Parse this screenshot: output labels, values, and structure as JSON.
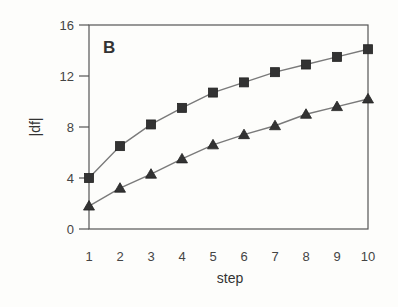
{
  "chart_data": {
    "type": "line",
    "title": "",
    "panel_label": "B",
    "xlabel": "step",
    "ylabel": "|df|",
    "x": [
      1,
      2,
      3,
      4,
      5,
      6,
      7,
      8,
      9,
      10
    ],
    "xticks": [
      "1",
      "2",
      "3",
      "4",
      "5",
      "6",
      "7",
      "8",
      "9",
      "10"
    ],
    "yticks": [
      "0",
      "4",
      "8",
      "12",
      "16"
    ],
    "xlim": [
      1,
      10
    ],
    "ylim": [
      0,
      16
    ],
    "grid": false,
    "legend": null,
    "series": [
      {
        "name": "squares",
        "marker": "square",
        "values": [
          4.0,
          6.5,
          8.2,
          9.5,
          10.7,
          11.5,
          12.3,
          12.9,
          13.5,
          14.1
        ]
      },
      {
        "name": "triangles",
        "marker": "triangle",
        "values": [
          1.8,
          3.2,
          4.3,
          5.5,
          6.6,
          7.4,
          8.1,
          9.0,
          9.6,
          10.2
        ]
      }
    ],
    "colors": {
      "line": "#7a7a7a",
      "marker": "#333333",
      "frame": "#555555"
    }
  }
}
